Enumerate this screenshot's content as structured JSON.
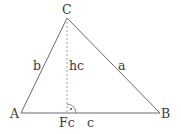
{
  "diagram": {
    "vertices": {
      "A": {
        "label": "A",
        "x": 21,
        "y": 113
      },
      "B": {
        "label": "B",
        "x": 160,
        "y": 113
      },
      "C": {
        "label": "C",
        "x": 67,
        "y": 18
      }
    },
    "foot": {
      "label": "Fc",
      "x": 67,
      "y": 113
    },
    "sides": {
      "a": {
        "label": "a",
        "from": "B",
        "to": "C"
      },
      "b": {
        "label": "b",
        "from": "A",
        "to": "C"
      },
      "c": {
        "label": "c",
        "from": "A",
        "to": "B"
      }
    },
    "altitude": {
      "label": "hc",
      "from": "C",
      "to": "Fc",
      "style": "dashed"
    },
    "right_angle_marker": {
      "at": "Fc",
      "symbol": "·"
    },
    "colors": {
      "lines": "#555555",
      "altitude": "#999999",
      "text": "#3a3a3a"
    }
  }
}
